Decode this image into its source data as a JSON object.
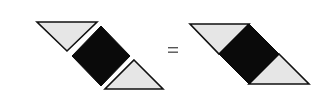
{
  "diagram": {
    "operator": "=",
    "colors": {
      "triangle_fill": "#e6e6e6",
      "square_fill": "#0a0a0a",
      "stroke": "#111111",
      "background": "#ffffff"
    },
    "left_figure": {
      "top_triangle": {
        "points": "37,22 97,22 67,51"
      },
      "square": {
        "points": "101,26 130,56 101,86 72,56"
      },
      "bottom_triangle": {
        "points": "134,60 163,89 105,89"
      }
    },
    "right_figure": {
      "top_triangle": {
        "points": "190,24 249,24 219,54"
      },
      "square": {
        "points": "249,24 279,54 249,84 219,54"
      },
      "bottom_triangle": {
        "points": "279,54 309,84 249,84"
      }
    }
  }
}
